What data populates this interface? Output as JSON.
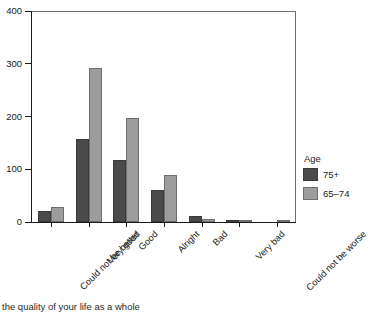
{
  "chart_data": {
    "type": "bar",
    "title": "",
    "xlabel": "",
    "ylabel": "",
    "ylim": [
      0,
      400
    ],
    "yticks": [
      0,
      100,
      200,
      300,
      400
    ],
    "grid": false,
    "legend_position": "right",
    "legend_title": "Age",
    "categories": [
      "Could not be better",
      "Very good",
      "Good",
      "Alright",
      "Bad",
      "Very bad",
      "Could not be worse"
    ],
    "series": [
      {
        "name": "75+",
        "color": "#4a4a4a",
        "values": [
          21,
          157,
          118,
          61,
          12,
          1,
          0
        ]
      },
      {
        "name": "65-74",
        "color": "#9c9c9c",
        "values": [
          28,
          292,
          197,
          89,
          5,
          3,
          4
        ]
      }
    ]
  },
  "axis": {
    "y_tick_labels": [
      "0",
      "100",
      "200",
      "300",
      "400"
    ]
  },
  "legend": {
    "title": "Age",
    "items": [
      {
        "label": "75+"
      },
      {
        "label": "65–74"
      }
    ]
  },
  "caption": {
    "text": "the quality of your life as a whole"
  }
}
